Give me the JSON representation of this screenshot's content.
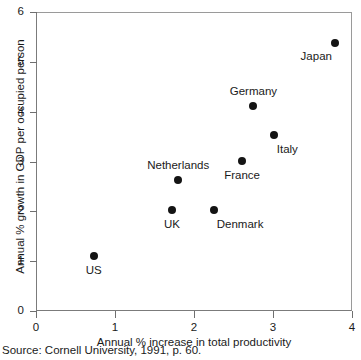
{
  "chart_data": {
    "type": "scatter",
    "title": "",
    "xlabel": "Annual % increase in total productivity",
    "ylabel": "Annual % growth in GDP per occupied person",
    "xlim": [
      0,
      4
    ],
    "ylim": [
      0,
      6
    ],
    "xticks": [
      "0",
      "1",
      "2",
      "3",
      "4"
    ],
    "yticks": [
      "0",
      "1",
      "2",
      "3",
      "4",
      "5",
      "6"
    ],
    "grid": false,
    "legend": "none",
    "marker_color": "#141414",
    "points": [
      {
        "label": "US",
        "x": 0.73,
        "y": 1.11,
        "label_pos": "below"
      },
      {
        "label": "UK",
        "x": 1.72,
        "y": 2.02,
        "label_pos": "below"
      },
      {
        "label": "Netherlands",
        "x": 1.8,
        "y": 2.62,
        "label_pos": "above"
      },
      {
        "label": "Denmark",
        "x": 2.25,
        "y": 2.02,
        "label_pos": "below-right"
      },
      {
        "label": "France",
        "x": 2.61,
        "y": 3.02,
        "label_pos": "below"
      },
      {
        "label": "Germany",
        "x": 2.75,
        "y": 4.12,
        "label_pos": "above"
      },
      {
        "label": "Italy",
        "x": 3.01,
        "y": 3.53,
        "label_pos": "below-right"
      },
      {
        "label": "Japan",
        "x": 3.78,
        "y": 5.37,
        "label_pos": "below-left"
      }
    ]
  },
  "source": "Source:  Cornell University, 1991, p. 60."
}
